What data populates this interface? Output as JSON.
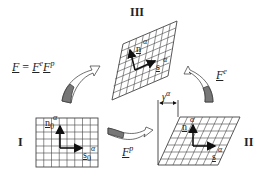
{
  "stage_labels": {
    "I": "I",
    "II": "II",
    "III": "III"
  },
  "equation": {
    "text": "F = F^e F^p",
    "lhs": "F",
    "eq": "=",
    "fe": "F",
    "fe_sup": "e",
    "fp": "F",
    "fp_sup": "p"
  },
  "arrows": {
    "elastic": {
      "label": "F",
      "sup": "e"
    },
    "plastic": {
      "label": "F",
      "sup": "p"
    }
  },
  "vectors": {
    "I": {
      "n": "n",
      "n_sub": "0",
      "n_sup": "α",
      "s": "s",
      "s_sub": "0",
      "s_sup": "α"
    },
    "II": {
      "n": "n",
      "n_sup": "α",
      "s": "s",
      "s_sup": "α"
    },
    "III": {
      "n": "n",
      "n_sup": "α",
      "s": "s",
      "s_sup": "α"
    }
  },
  "shear": {
    "label": "γ",
    "sup": "α"
  },
  "colors": {
    "line": "#333333",
    "arrow_fill": "#777777",
    "grid": "#444444"
  }
}
